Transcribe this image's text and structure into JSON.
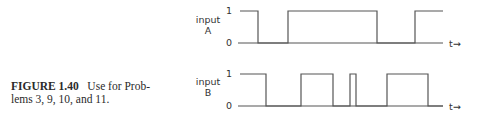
{
  "caption": {
    "figure_label": "FIGURE 1.40",
    "text_line1": "Use for Prob-",
    "text_line2": "lems 3, 9, 10, and 11."
  },
  "signals": [
    {
      "name": "input A",
      "label_line1": "input",
      "label_line2": "A",
      "level_high": "1",
      "level_low": "0",
      "time_label": "t→",
      "edges_px": [
        240,
        258,
        288,
        377,
        415,
        443
      ],
      "initial_state": 1
    },
    {
      "name": "input B",
      "label_line1": "input",
      "label_line2": "B",
      "level_high": "1",
      "level_low": "0",
      "time_label": "t→",
      "edges_px": [
        240,
        266,
        301,
        333,
        350,
        356,
        387,
        428,
        443
      ],
      "initial_state": 1
    }
  ],
  "colors": {
    "trace": "#555555",
    "text": "#333333"
  }
}
